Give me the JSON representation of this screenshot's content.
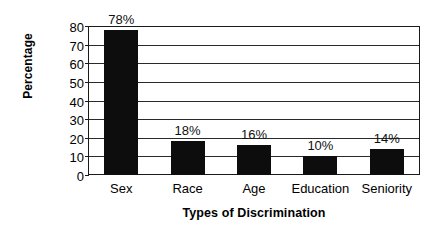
{
  "chart_data": {
    "type": "bar",
    "title": "",
    "xlabel": "Types of Discrimination",
    "ylabel": "Percentage",
    "categories": [
      "Sex",
      "Race",
      "Age",
      "Education",
      "Seniority"
    ],
    "values": [
      78,
      18,
      16,
      10,
      14
    ],
    "value_labels": [
      "78%",
      "18%",
      "16%",
      "10%",
      "14%"
    ],
    "ylim": [
      0,
      80
    ],
    "ytick_labels": [
      "80",
      "70",
      "60",
      "50",
      "40",
      "30",
      "20",
      "10",
      "0"
    ],
    "ytick_values": [
      80,
      70,
      60,
      50,
      40,
      30,
      20,
      10,
      0
    ],
    "grid": "horizontal",
    "legend": "none",
    "bar_color": "#0d0d0d",
    "axis_color": "#1a1a1a",
    "background_color": "#ffffff"
  }
}
